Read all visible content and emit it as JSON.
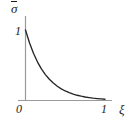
{
  "figure": {
    "background_color": "#ffffff",
    "axis_color": "#9a9a9a",
    "curve_color": "#262626",
    "text_color": "#1a1a1a",
    "ylabel": "σ",
    "ylabel_base": "σ",
    "ylabel_accent": "overbar",
    "xlabel": "ξ",
    "origin_label": "0",
    "xtick_label": "1",
    "ytick_label": "1"
  },
  "chart_data": {
    "type": "line",
    "title": "",
    "subtitle": "",
    "xlabel": "ξ",
    "ylabel": "σ̄",
    "xlim": [
      0,
      1.08
    ],
    "ylim": [
      0,
      1.18
    ],
    "xticks": [
      0,
      1
    ],
    "xtick_labels": [
      "0",
      "1"
    ],
    "yticks": [
      1
    ],
    "ytick_labels": [
      "1"
    ],
    "grid": false,
    "legend": null,
    "annotations": [],
    "series": [
      {
        "name": "normalized stress decay",
        "description": "exponential decay from 1 at xi=0 to near 0 at xi=1",
        "model": "exp(-4*xi)",
        "x": [
          0.0,
          0.05,
          0.1,
          0.15,
          0.2,
          0.25,
          0.3,
          0.35,
          0.4,
          0.45,
          0.5,
          0.55,
          0.6,
          0.65,
          0.7,
          0.75,
          0.8,
          0.85,
          0.9,
          0.95,
          1.0
        ],
        "y": [
          1.0,
          0.819,
          0.67,
          0.549,
          0.449,
          0.368,
          0.301,
          0.247,
          0.202,
          0.165,
          0.135,
          0.111,
          0.091,
          0.074,
          0.061,
          0.05,
          0.041,
          0.033,
          0.027,
          0.022,
          0.018
        ]
      }
    ]
  }
}
